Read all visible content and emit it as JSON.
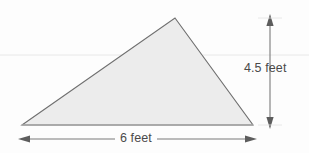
{
  "figure": {
    "type": "geometry-diagram",
    "shape": "triangle",
    "colors": {
      "background": "#fdfdfd",
      "triangle_fill": "#ececec",
      "triangle_stroke": "#6f6f6f",
      "baseline_stroke": "#a8a8a8",
      "arrow_stroke": "#7a7a7a",
      "ruling_line": "#e8e8e8",
      "text": "#4a4a4a"
    },
    "triangle": {
      "apex": {
        "x": 175,
        "y": 18
      },
      "bottom_left": {
        "x": 22,
        "y": 125
      },
      "bottom_right": {
        "x": 253,
        "y": 125
      }
    },
    "height_dimension": {
      "label": "4.5 feet",
      "value": 4.5,
      "unit": "feet",
      "orientation": "vertical",
      "arrow_x": 270,
      "arrow_top_y": 18,
      "arrow_bottom_y": 125
    },
    "width_dimension": {
      "label": "6 feet",
      "value": 6,
      "unit": "feet",
      "orientation": "horizontal",
      "arrow_y": 139,
      "arrow_left_x": 22,
      "arrow_right_x": 253
    },
    "ruling_line": {
      "y": 55,
      "x_start": 0,
      "x_end": 309
    }
  }
}
